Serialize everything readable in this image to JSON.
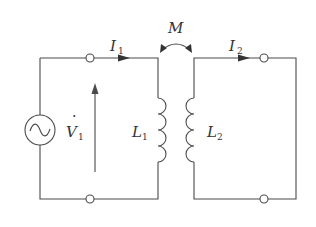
{
  "diagram": {
    "type": "mutual-inductance-circuit",
    "labels": {
      "current_primary": "I",
      "current_primary_sub": "1",
      "current_secondary": "I",
      "current_secondary_sub": "2",
      "mutual": "M",
      "voltage": "V",
      "voltage_sub": "1",
      "voltage_dot": "·",
      "inductor_primary": "L",
      "inductor_primary_sub": "1",
      "inductor_secondary": "L",
      "inductor_secondary_sub": "2"
    },
    "components": [
      {
        "id": "source",
        "kind": "ac-voltage-source",
        "symbol": "~"
      },
      {
        "id": "L1",
        "kind": "inductor"
      },
      {
        "id": "L2",
        "kind": "inductor"
      }
    ],
    "colors": {
      "line": "#4a4a4a",
      "text": "#333333",
      "background": "#ffffff"
    }
  }
}
